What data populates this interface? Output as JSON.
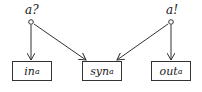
{
  "nodes": {
    "input": {
      "label": "a?",
      "shape": "circle"
    },
    "output": {
      "label": "a!",
      "shape": "circle"
    }
  },
  "boxes": [
    {
      "id": "in",
      "base": "in",
      "sub": "a"
    },
    {
      "id": "syn",
      "base": "syn",
      "sub": "a"
    },
    {
      "id": "out",
      "base": "out",
      "sub": "a"
    }
  ],
  "edges": [
    {
      "from": "a?",
      "to": "in_a"
    },
    {
      "from": "a?",
      "to": "syn_a"
    },
    {
      "from": "a!",
      "to": "syn_a"
    },
    {
      "from": "a!",
      "to": "out_a"
    }
  ],
  "colors": {
    "stroke": "#333333",
    "background": "#ffffff"
  }
}
